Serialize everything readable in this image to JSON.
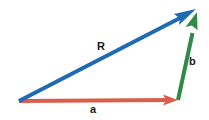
{
  "figure": {
    "kind": "vector-addition-triangle",
    "background_color": "#ffffff",
    "width": 209,
    "height": 120
  },
  "vectors": [
    {
      "id": "a",
      "label": "a",
      "color": "#d95f4c",
      "role": "first-component",
      "start": {
        "x": 19,
        "y": 101
      },
      "end": {
        "x": 178,
        "y": 100
      },
      "label_position": {
        "x": 90,
        "y": 104
      }
    },
    {
      "id": "b",
      "label": "b",
      "color": "#2f8a47",
      "role": "second-component",
      "start": {
        "x": 178,
        "y": 100
      },
      "end": {
        "x": 197,
        "y": 12
      },
      "label_position": {
        "x": 189,
        "y": 56
      }
    },
    {
      "id": "R",
      "label": "R",
      "color": "#1f6ab0",
      "role": "resultant",
      "start": {
        "x": 19,
        "y": 101
      },
      "end": {
        "x": 196,
        "y": 9
      },
      "label_position": {
        "x": 97,
        "y": 41
      }
    }
  ],
  "colors": {
    "red": "#d95f4c",
    "green": "#2f8a47",
    "blue": "#1f6ab0",
    "label_text": "#1a1a1a",
    "background": "#ffffff"
  }
}
